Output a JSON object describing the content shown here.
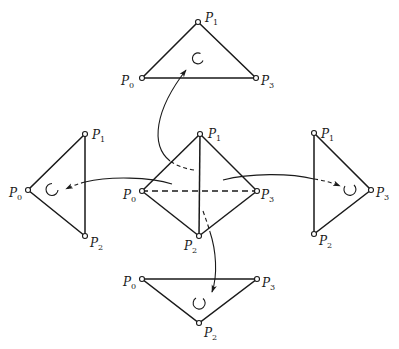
{
  "diagram": {
    "colors": {
      "stroke": "#1a1a1a",
      "background": "#ffffff"
    },
    "center_tetrahedron": {
      "labels": {
        "p0": "P",
        "p0_sub": "0",
        "p1": "P",
        "p1_sub": "1",
        "p2": "P",
        "p2_sub": "2",
        "p3": "P",
        "p3_sub": "3"
      }
    },
    "faces": {
      "top": {
        "vertices": [
          "P0",
          "P1",
          "P3"
        ],
        "labels": {
          "p0": "P",
          "p0_sub": "0",
          "p1": "P",
          "p1_sub": "1",
          "p3": "P",
          "p3_sub": "3"
        },
        "orientation": "counterclockwise"
      },
      "left": {
        "vertices": [
          "P0",
          "P1",
          "P2"
        ],
        "labels": {
          "p0": "P",
          "p0_sub": "0",
          "p1": "P",
          "p1_sub": "1",
          "p2": "P",
          "p2_sub": "2"
        },
        "orientation": "clockwise"
      },
      "right": {
        "vertices": [
          "P1",
          "P2",
          "P3"
        ],
        "labels": {
          "p1": "P",
          "p1_sub": "1",
          "p2": "P",
          "p2_sub": "2",
          "p3": "P",
          "p3_sub": "3"
        },
        "orientation": "clockwise"
      },
      "bottom": {
        "vertices": [
          "P0",
          "P2",
          "P3"
        ],
        "labels": {
          "p0": "P",
          "p0_sub": "0",
          "p2": "P",
          "p2_sub": "2",
          "p3": "P",
          "p3_sub": "3"
        },
        "orientation": "counterclockwise"
      }
    }
  }
}
